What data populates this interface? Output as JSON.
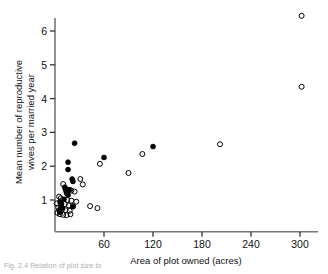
{
  "figure": {
    "caption": "Fig. 2.4  Relation of plot size to",
    "axes": {
      "x": {
        "label": "Area of plot owned (acres)",
        "ticks": [
          60,
          120,
          180,
          240,
          300
        ],
        "min": 0,
        "max": 320
      },
      "y": {
        "label_line1": "Mean number of reproductive",
        "label_line2": "wives per married year",
        "ticks": [
          1,
          2,
          3,
          4,
          5,
          6
        ],
        "min": 0,
        "max": 6.8
      }
    }
  },
  "chart_data": {
    "type": "scatter",
    "title": "",
    "xlabel": "Area of plot owned (acres)",
    "ylabel": "Mean number of reproductive wives per married year",
    "xlim": [
      0,
      320
    ],
    "ylim": [
      0,
      6.8
    ],
    "xticks": [
      60,
      120,
      180,
      240,
      300
    ],
    "yticks": [
      1,
      2,
      3,
      4,
      5,
      6
    ],
    "grid": false,
    "legend": "none",
    "marker_styles": {
      "filled": "filled black circle",
      "open": "open circle"
    },
    "series": [
      {
        "name": "filled",
        "marker": "filled",
        "points": [
          [
            24.0,
            2.68
          ],
          [
            16.0,
            2.12
          ],
          [
            16.0,
            1.9
          ],
          [
            21.0,
            1.62
          ],
          [
            22.0,
            1.55
          ],
          [
            12.0,
            1.38
          ],
          [
            13.0,
            1.3
          ],
          [
            17.0,
            1.3
          ],
          [
            14.0,
            1.22
          ],
          [
            15.0,
            1.18
          ],
          [
            16.0,
            1.15
          ],
          [
            11.0,
            1.02
          ],
          [
            6.0,
            0.95
          ],
          [
            8.0,
            0.88
          ],
          [
            7.0,
            0.8
          ],
          [
            9.0,
            0.76
          ],
          [
            5.0,
            0.7
          ],
          [
            6.0,
            0.64
          ],
          [
            22.0,
            0.8
          ],
          [
            60.0,
            2.26
          ],
          [
            120.0,
            2.58
          ]
        ]
      },
      {
        "name": "open",
        "marker": "open",
        "points": [
          [
            302.0,
            6.45
          ],
          [
            302.0,
            4.35
          ],
          [
            202.0,
            2.65
          ],
          [
            107.0,
            2.36
          ],
          [
            55.0,
            2.07
          ],
          [
            90.0,
            1.8
          ],
          [
            31.0,
            1.62
          ],
          [
            34.0,
            1.46
          ],
          [
            10.0,
            1.47
          ],
          [
            13.0,
            1.33
          ],
          [
            18.0,
            1.3
          ],
          [
            20.0,
            1.28
          ],
          [
            24.0,
            1.25
          ],
          [
            7.0,
            1.05
          ],
          [
            15.0,
            1.0
          ],
          [
            20.0,
            0.98
          ],
          [
            26.0,
            0.95
          ],
          [
            12.0,
            0.88
          ],
          [
            17.0,
            0.84
          ],
          [
            22.0,
            0.82
          ],
          [
            4.0,
            0.78
          ],
          [
            9.0,
            0.74
          ],
          [
            13.0,
            0.7
          ],
          [
            18.0,
            0.68
          ],
          [
            3.0,
            0.62
          ],
          [
            6.0,
            0.58
          ],
          [
            10.0,
            0.56
          ],
          [
            14.0,
            0.55
          ],
          [
            19.0,
            0.58
          ],
          [
            43.0,
            0.82
          ],
          [
            52.0,
            0.76
          ],
          [
            2.0,
            0.9
          ],
          [
            5.0,
            1.1
          ]
        ]
      }
    ]
  }
}
